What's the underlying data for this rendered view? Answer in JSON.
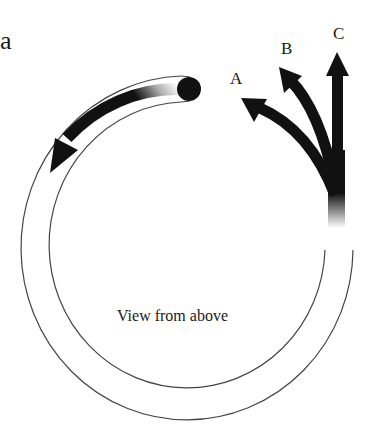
{
  "figure": {
    "panel_label": "a",
    "caption": "View from above",
    "path_labels": {
      "a": "A",
      "b": "B",
      "c": "C"
    },
    "elements": {
      "track": "circular tube, open gap at upper right",
      "ball": "black ball at tube exit",
      "motion_arrow": "curved arrow inside tube indicating circular motion",
      "exit_paths": [
        "A: curves left",
        "B: curves slightly left",
        "C: straight"
      ]
    },
    "colors": {
      "ink": "#111111",
      "track_line": "#444444",
      "background": "#ffffff"
    }
  }
}
